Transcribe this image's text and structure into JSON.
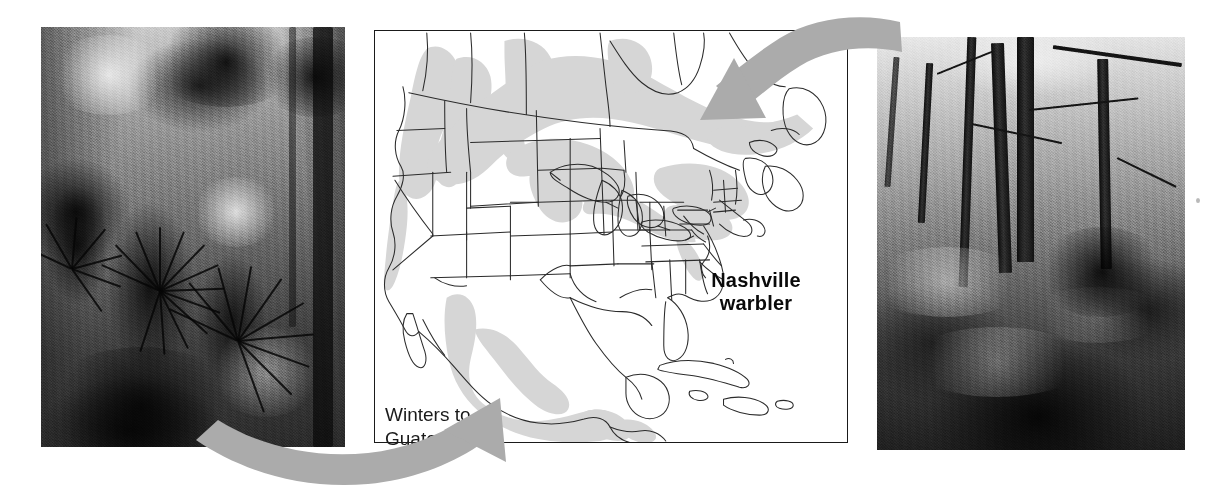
{
  "figure": {
    "kind": "migration-range-map-figure",
    "species": "Nashville warbler"
  },
  "map": {
    "title": "Nashville warbler range map",
    "species_label_line1": "Nashville",
    "species_label_line2": "warbler",
    "wintering_label_line1": "Winters to",
    "wintering_label_line2": "Guatemala",
    "region": "North America",
    "frame_color": "#1a1a1a",
    "range_shading_color": "#d4d4d4",
    "coastline_color": "#2a2a2a",
    "background_color": "#ffffff",
    "breeding_range_regions": [
      "British Columbia",
      "Washington",
      "Oregon",
      "Idaho",
      "Sierra Nevada, California",
      "Southern Canada prairie provinces",
      "Ontario",
      "Quebec",
      "Great Lakes states",
      "New England",
      "Pennsylvania",
      "New York"
    ],
    "wintering_range_regions": [
      "Western Mexico",
      "Pacific slope of Mexico",
      "Southern Mexico",
      "Guatemala"
    ]
  },
  "photos": {
    "left": {
      "caption_semantic": "tropical wintering habitat",
      "description": "Black and white photograph of a tropical forest understory with fan palms and dense vegetation",
      "tone": "black-and-white"
    },
    "right": {
      "caption_semantic": "temperate breeding habitat",
      "description": "Black and white photograph of a temperate deciduous forest slope with bare tree trunks and leaf litter",
      "tone": "black-and-white"
    }
  },
  "arrows": {
    "color": "#aaaaaa",
    "top": {
      "semantic": "breeding-habitat-to-map-arrow",
      "from": "right temperate forest photo",
      "to": "northeastern North America breeding range",
      "direction": "right-to-left"
    },
    "bottom": {
      "semantic": "wintering-habitat-to-map-arrow",
      "from": "left tropical forest photo",
      "to": "Mexico / Central America wintering range",
      "direction": "left-to-right"
    }
  }
}
